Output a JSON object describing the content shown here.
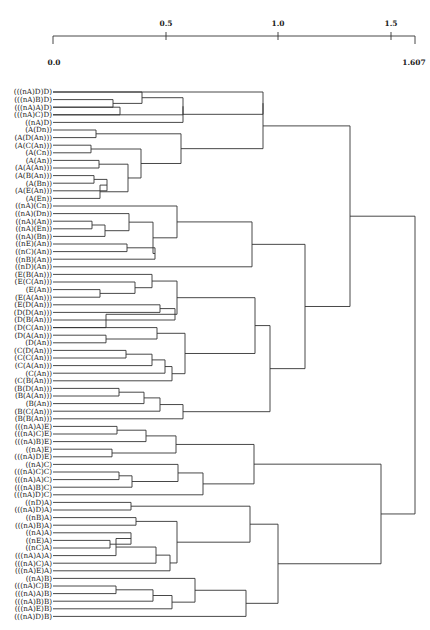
{
  "chart_data": {
    "type": "dendrogram",
    "title": "",
    "xlabel": "",
    "ylabel": "",
    "axis": {
      "min": 0.0,
      "max": 1.607,
      "ticks_top": [
        0.5,
        1.0,
        1.5
      ],
      "labels_bottom": [
        "0.0",
        "1.607"
      ],
      "tick_labels_top": [
        "0.5",
        "1.0",
        "1.5"
      ]
    },
    "leaves": [
      "(((nA)D)D)",
      "(((nA)B)D)",
      "(((nA)A)D)",
      "(((nA)C)D)",
      "((nA)D)",
      "(A(Dn))",
      "(A(D(An)))",
      "(A(C(An)))",
      "(A(Cn))",
      "(A(An))",
      "(A(A(An)))",
      "(A(B(An)))",
      "(A(Bn))",
      "(A(E(An)))",
      "(A(En))",
      "((nA)(Cn))",
      "((nA)(Dn))",
      "((nA)(An))",
      "((nA)(En))",
      "((nA)(Bn))",
      "((nE)(An))",
      "((nC)(An))",
      "((nB)(An))",
      "((nD)(An))",
      "(E(B(An)))",
      "(E(C(An)))",
      "(E(An))",
      "(E(A(An)))",
      "(E(D(An)))",
      "(D(D(An)))",
      "(D(B(An)))",
      "(D(C(An)))",
      "(D(A(An)))",
      "(D(An))",
      "(C(D(An)))",
      "(C(C(An)))",
      "(C(A(An)))",
      "(C(An))",
      "(C(B(An)))",
      "(B(D(An)))",
      "(B(A(An)))",
      "(B(An))",
      "(B(C(An)))",
      "(B(B(An)))",
      "(((nA)A)E)",
      "(((nA)C)E)",
      "(((nA)B)E)",
      "((nA)E)",
      "(((nA)D)E)",
      "((nA)C)",
      "(((nA)C)C)",
      "(((nA)A)C)",
      "(((nA)B)C)",
      "(((nA)D)C)",
      "((nD)A)",
      "(((nA)D)A)",
      "((nB)A)",
      "(((nA)B)A)",
      "((nA)A)",
      "((nE)A)",
      "((nC)A)",
      "(((nA)A)A)",
      "(((nA)C)A)",
      "(((nA)E)A)",
      "((nA)B)",
      "(((nA)C)B)",
      "(((nA)A)B)",
      "(((nA)B)B)",
      "(((nA)E)B)",
      "(((nA)D)B)"
    ],
    "merges": [
      {
        "a": "L1",
        "b": "L2",
        "h": 0.48,
        "id": "m1"
      },
      {
        "a": "L2",
        "b": "L3",
        "h": 0.57,
        "id": "m2"
      },
      {
        "a": "L0",
        "b": "m1",
        "h": 0.58,
        "id": "m3"
      },
      {
        "a": "m3",
        "b": "L4",
        "h": 0.95,
        "id": "m4"
      },
      {
        "a": "L5",
        "b": "L6",
        "h": 0.16,
        "id": "m5"
      },
      {
        "a": "L7",
        "b": "L8",
        "h": 0.14,
        "id": "m6"
      },
      {
        "a": "L9",
        "b": "L10",
        "h": 0.18,
        "id": "m7"
      },
      {
        "a": "L11",
        "b": "L12",
        "h": 0.15,
        "id": "m8"
      },
      {
        "a": "m8",
        "b": "L13",
        "h": 0.21,
        "id": "m9"
      },
      {
        "a": "m9",
        "b": "L14",
        "h": 0.25,
        "id": "m10"
      },
      {
        "a": "m7",
        "b": "m10",
        "h": 0.32,
        "id": "m11"
      },
      {
        "a": "m6",
        "b": "m11",
        "h": 0.44,
        "id": "m12"
      },
      {
        "a": "m5",
        "b": "m12",
        "h": 0.74,
        "id": "m13"
      },
      {
        "a": "L15",
        "b": "L16",
        "h": 0.15,
        "id": "m14"
      },
      {
        "a": "L17",
        "b": "L18",
        "h": 0.33,
        "id": "m15"
      },
      {
        "a": "L19",
        "b": "L20",
        "h": 0.42,
        "id": "m16"
      }
    ],
    "structure_note": "Single hierarchical tree of 70 leaves; top-level merge at height 1.607 joining an upper cluster (leaves 0-43) and a lower cluster (leaves 44-69)."
  }
}
